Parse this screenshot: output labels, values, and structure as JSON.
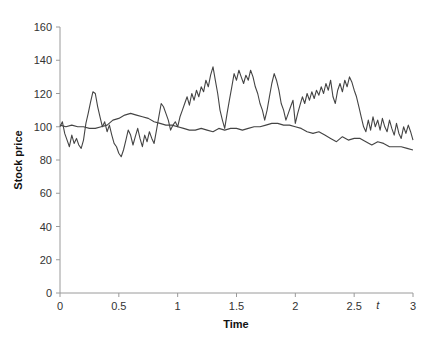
{
  "chart_data": {
    "type": "line",
    "title": "",
    "xlabel": "Time",
    "ylabel": "Stock price",
    "xlim": [
      0,
      3
    ],
    "ylim": [
      0,
      160
    ],
    "xticks": [
      0,
      0.5,
      1,
      1.5,
      2,
      2.5,
      3
    ],
    "xtick_labels": [
      "0",
      "0.5",
      "1",
      "1.5",
      "2",
      "2.5",
      "3"
    ],
    "yticks": [
      0,
      20,
      40,
      60,
      80,
      100,
      120,
      140,
      160
    ],
    "ytick_labels": [
      "0",
      "20",
      "40",
      "60",
      "80",
      "100",
      "120",
      "140",
      "160"
    ],
    "grid": false,
    "legend": null,
    "annotations": [
      {
        "text": "t",
        "x": 2.7,
        "y": -6,
        "style": "italic"
      }
    ],
    "series": [
      {
        "name": "Volatile path",
        "color": "#444444",
        "x": [
          0,
          0.02,
          0.04,
          0.06,
          0.08,
          0.1,
          0.12,
          0.14,
          0.16,
          0.18,
          0.2,
          0.22,
          0.24,
          0.26,
          0.28,
          0.3,
          0.32,
          0.34,
          0.36,
          0.38,
          0.4,
          0.42,
          0.44,
          0.46,
          0.48,
          0.5,
          0.52,
          0.54,
          0.56,
          0.58,
          0.6,
          0.62,
          0.64,
          0.66,
          0.68,
          0.7,
          0.72,
          0.74,
          0.76,
          0.78,
          0.8,
          0.82,
          0.84,
          0.86,
          0.88,
          0.9,
          0.92,
          0.94,
          0.96,
          0.98,
          1.0,
          1.02,
          1.04,
          1.06,
          1.08,
          1.1,
          1.12,
          1.14,
          1.16,
          1.18,
          1.2,
          1.22,
          1.24,
          1.26,
          1.28,
          1.3,
          1.32,
          1.34,
          1.36,
          1.38,
          1.4,
          1.42,
          1.44,
          1.46,
          1.48,
          1.5,
          1.52,
          1.54,
          1.56,
          1.58,
          1.6,
          1.62,
          1.64,
          1.66,
          1.68,
          1.7,
          1.72,
          1.74,
          1.76,
          1.78,
          1.8,
          1.82,
          1.84,
          1.86,
          1.88,
          1.9,
          1.92,
          1.94,
          1.96,
          1.98,
          2.0,
          2.02,
          2.04,
          2.06,
          2.08,
          2.1,
          2.12,
          2.14,
          2.16,
          2.18,
          2.2,
          2.22,
          2.24,
          2.26,
          2.28,
          2.3,
          2.32,
          2.34,
          2.36,
          2.38,
          2.4,
          2.42,
          2.44,
          2.46,
          2.48,
          2.5,
          2.52,
          2.54,
          2.56,
          2.58,
          2.6,
          2.62,
          2.64,
          2.66,
          2.68,
          2.7,
          2.72,
          2.74,
          2.76,
          2.78,
          2.8,
          2.82,
          2.84,
          2.86,
          2.88,
          2.9,
          2.92,
          2.94,
          2.96,
          2.98,
          3.0
        ],
        "y": [
          100,
          103,
          96,
          92,
          88,
          95,
          90,
          93,
          89,
          87,
          92,
          102,
          108,
          115,
          121,
          120,
          112,
          106,
          100,
          103,
          97,
          101,
          95,
          90,
          88,
          84,
          82,
          86,
          92,
          98,
          95,
          89,
          94,
          99,
          93,
          88,
          95,
          91,
          97,
          93,
          90,
          98,
          106,
          114,
          112,
          108,
          104,
          98,
          101,
          103,
          100,
          106,
          110,
          114,
          118,
          113,
          120,
          116,
          122,
          118,
          124,
          121,
          128,
          124,
          131,
          136,
          128,
          120,
          110,
          104,
          99,
          108,
          116,
          124,
          132,
          128,
          134,
          130,
          126,
          131,
          128,
          134,
          130,
          124,
          120,
          114,
          110,
          104,
          110,
          118,
          126,
          132,
          128,
          122,
          114,
          110,
          104,
          108,
          112,
          116,
          102,
          108,
          113,
          118,
          114,
          120,
          116,
          121,
          117,
          122,
          119,
          124,
          120,
          126,
          122,
          128,
          118,
          114,
          122,
          126,
          121,
          128,
          124,
          130,
          127,
          122,
          118,
          112,
          106,
          100,
          97,
          104,
          98,
          106,
          100,
          104,
          98,
          105,
          100,
          97,
          104,
          99,
          95,
          102,
          96,
          93,
          100,
          96,
          101,
          97,
          92
        ],
        "path_style": "jagged random walk"
      },
      {
        "name": "Smooth path",
        "color": "#444444",
        "x": [
          0,
          0.05,
          0.1,
          0.15,
          0.2,
          0.25,
          0.3,
          0.35,
          0.4,
          0.45,
          0.5,
          0.55,
          0.6,
          0.65,
          0.7,
          0.75,
          0.8,
          0.85,
          0.9,
          0.95,
          1.0,
          1.05,
          1.1,
          1.15,
          1.2,
          1.25,
          1.3,
          1.35,
          1.4,
          1.45,
          1.5,
          1.55,
          1.6,
          1.65,
          1.7,
          1.75,
          1.8,
          1.85,
          1.9,
          1.95,
          2.0,
          2.05,
          2.1,
          2.15,
          2.2,
          2.25,
          2.3,
          2.35,
          2.4,
          2.45,
          2.5,
          2.55,
          2.6,
          2.65,
          2.7,
          2.75,
          2.8,
          2.85,
          2.9,
          2.95,
          3.0
        ],
        "y": [
          101,
          100,
          101,
          100,
          100,
          99,
          99,
          100,
          101,
          104,
          105,
          107,
          108,
          107,
          106,
          105,
          103,
          102,
          101,
          101,
          100,
          99,
          98,
          98,
          99,
          98,
          97,
          99,
          98,
          99,
          99,
          98,
          99,
          100,
          100,
          101,
          102,
          102,
          101,
          101,
          100,
          99,
          97,
          96,
          97,
          95,
          93,
          91,
          94,
          92,
          93,
          93,
          91,
          89,
          91,
          90,
          88,
          88,
          88,
          87,
          86
        ],
        "path_style": "smooth low-volatility"
      }
    ]
  }
}
